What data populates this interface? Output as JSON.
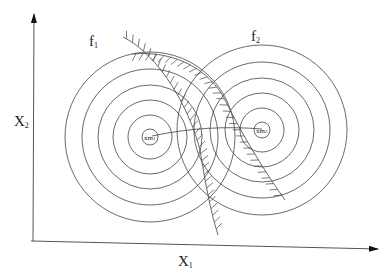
{
  "diagram": {
    "type": "contour-plot-with-constraints",
    "axes": {
      "x_label": "X",
      "x_sub": "1",
      "y_label": "X",
      "y_sub": "2"
    },
    "functions": [
      {
        "label": "f",
        "sub": "1",
        "center": [
          150,
          137
        ],
        "radii": [
          8,
          22,
          37,
          52,
          68,
          85
        ],
        "min_label": "xm",
        "min_sub": "1"
      },
      {
        "label": "f",
        "sub": "2",
        "center": [
          262,
          130
        ],
        "radii": [
          8,
          22,
          37,
          52,
          68,
          85
        ],
        "min_label": "xm",
        "min_sub": "2"
      }
    ],
    "constraints": [
      {
        "name": "constraint-1",
        "hatched": true
      },
      {
        "name": "constraint-2",
        "hatched": true
      }
    ],
    "colors": {
      "line": "#333333",
      "background": "#ffffff"
    }
  }
}
